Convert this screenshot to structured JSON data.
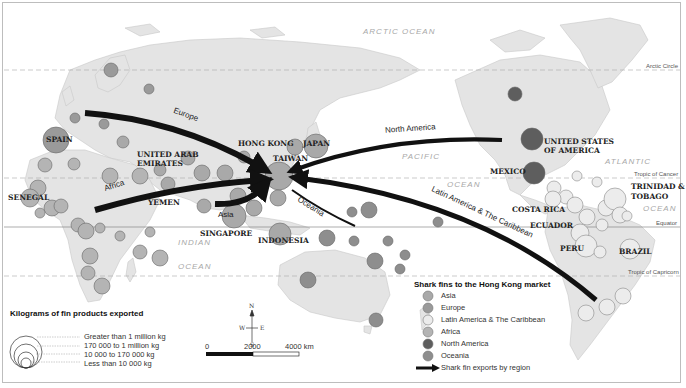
{
  "map": {
    "title": "Shark fins to the Hong Kong market",
    "ocean_labels": [
      {
        "text": "ARCTIC OCEAN",
        "x": 363,
        "y": 27
      },
      {
        "text": "PACIFIC",
        "x": 402,
        "y": 152
      },
      {
        "text": "OCEAN",
        "x": 447,
        "y": 184
      },
      {
        "text": "ATLANTIC",
        "x": 603,
        "y": 157
      },
      {
        "text": "OCEAN",
        "x": 643,
        "y": 206
      },
      {
        "text": "INDIAN",
        "x": 178,
        "y": 240
      },
      {
        "text": "OCEAN",
        "x": 178,
        "y": 264
      }
    ],
    "latitude_lines": [
      {
        "name": "Arctic Circle",
        "y": 70
      },
      {
        "name": "Tropic of Cancer",
        "y": 178
      },
      {
        "name": "Equator",
        "y": 227
      },
      {
        "name": "Tropic of Capricorn",
        "y": 276
      }
    ],
    "country_labels": [
      {
        "text": "SPAIN",
        "x": 46,
        "y": 136
      },
      {
        "text": "UNITED ARAB",
        "x": 137,
        "y": 150
      },
      {
        "text": "EMIRATES",
        "x": 137,
        "y": 159
      },
      {
        "text": "SENEGAL",
        "x": 8,
        "y": 194
      },
      {
        "text": "YEMEN",
        "x": 148,
        "y": 199
      },
      {
        "text": "HONG KONG",
        "x": 238,
        "y": 140
      },
      {
        "text": "TAIWAN",
        "x": 273,
        "y": 155
      },
      {
        "text": "JAPAN",
        "x": 303,
        "y": 140
      },
      {
        "text": "SINGAPORE",
        "x": 200,
        "y": 230
      },
      {
        "text": "INDONESIA",
        "x": 258,
        "y": 236
      },
      {
        "text": "UNITED STATES",
        "x": 544,
        "y": 137
      },
      {
        "text": "OF AMERICA",
        "x": 544,
        "y": 146
      },
      {
        "text": "MEXICO",
        "x": 490,
        "y": 168
      },
      {
        "text": "TRINIDAD &",
        "x": 631,
        "y": 183
      },
      {
        "text": "TOBAGO",
        "x": 631,
        "y": 193
      },
      {
        "text": "COSTA RICA",
        "x": 512,
        "y": 206
      },
      {
        "text": "ECUADOR",
        "x": 530,
        "y": 222
      },
      {
        "text": "PERU",
        "x": 560,
        "y": 245
      },
      {
        "text": "BRAZIL",
        "x": 620,
        "y": 248
      }
    ],
    "flow_labels": [
      {
        "text": "Europe",
        "x": 173,
        "y": 110,
        "rotate": 20
      },
      {
        "text": "North America",
        "x": 385,
        "y": 128,
        "rotate": -4
      },
      {
        "text": "Latin America & The Caribbean",
        "x": 436,
        "y": 192,
        "rotate": 24
      },
      {
        "text": "Africa",
        "x": 104,
        "y": 183,
        "rotate": -18
      },
      {
        "text": "Asia",
        "x": 220,
        "y": 212,
        "rotate": 0
      },
      {
        "text": "Oceania",
        "x": 298,
        "y": 204,
        "rotate": 32
      }
    ]
  },
  "legend_size": {
    "title": "Kilograms of fin products exported",
    "items": [
      "Greater than 1 million kg",
      "170 000 to 1 million kg",
      "10 000 to 170 000 kg",
      "Less than 10 000 kg"
    ]
  },
  "legend_region": {
    "title": "Shark fins to the Hong Kong market",
    "items": [
      {
        "label": "Asia",
        "color": "#a9a9a9"
      },
      {
        "label": "Europe",
        "color": "#9a9a9a"
      },
      {
        "label": "Latin America & The Caribbean",
        "color": "#ececec"
      },
      {
        "label": "Africa",
        "color": "#b4b4b4"
      },
      {
        "label": "North America",
        "color": "#5e5e5e"
      },
      {
        "label": "Oceania",
        "color": "#8e8e8e"
      }
    ],
    "arrow_label": "Shark fin exports by region"
  },
  "compass": {
    "n": "N",
    "s": "S",
    "e": "E",
    "w": "W"
  },
  "scale_bar": {
    "ticks": [
      "0",
      "2000",
      "4000 km"
    ]
  }
}
